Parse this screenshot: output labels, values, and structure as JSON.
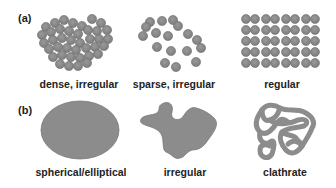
{
  "figure": {
    "panel_a": {
      "label": "(a)",
      "items": [
        {
          "caption": "dense, irregular"
        },
        {
          "caption": "sparse, irregular"
        },
        {
          "caption": "regular"
        }
      ]
    },
    "panel_b": {
      "label": "(b)",
      "items": [
        {
          "caption": "spherical/elliptical"
        },
        {
          "caption": "irregular"
        },
        {
          "caption": "clathrate"
        }
      ]
    },
    "colors": {
      "particle_fill": "#8a8a8a",
      "particle_stroke": "#6e6e6e",
      "shape_fill": "#8c8c8c",
      "text": "#222222"
    }
  }
}
